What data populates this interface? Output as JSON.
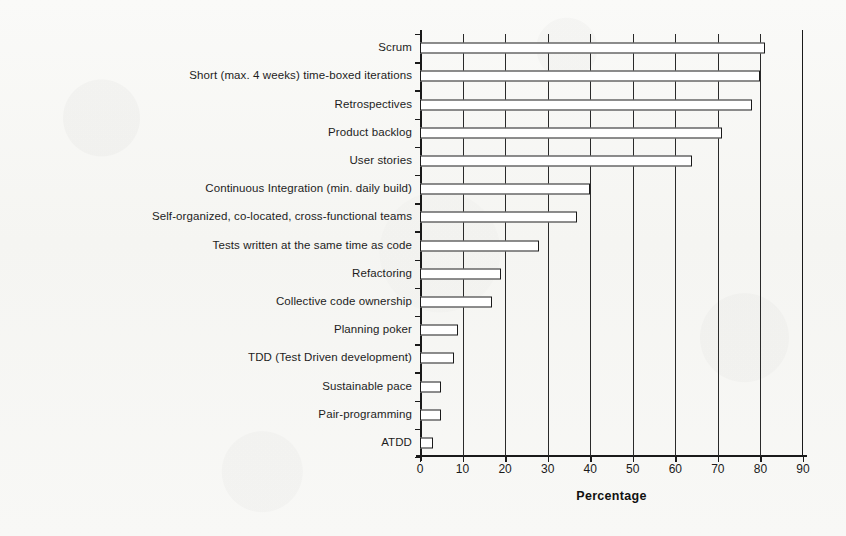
{
  "chart_data": {
    "type": "bar",
    "orientation": "horizontal",
    "title": "",
    "xlabel": "Percentage",
    "ylabel": "",
    "xlim": [
      0,
      90
    ],
    "xticks": [
      0,
      10,
      20,
      30,
      40,
      50,
      60,
      70,
      80,
      90
    ],
    "xticklabels": [
      "0",
      "10",
      "20",
      "30",
      "40",
      "50",
      "60",
      "70",
      "80",
      "90"
    ],
    "grid": "vertical",
    "legend": "none",
    "bar_style": {
      "fill": "#ffffff",
      "edge": "#1a1a1a"
    },
    "categories": [
      "Scrum",
      "Short (max. 4 weeks) time-boxed iterations",
      "Retrospectives",
      "Product backlog",
      "User stories",
      "Continuous Integration (min. daily build)",
      "Self-organized, co-located, cross-functional teams",
      "Tests written at the same time as code",
      "Refactoring",
      "Collective code ownership",
      "Planning poker",
      "TDD (Test Driven development)",
      "Sustainable pace",
      "Pair-programming",
      "ATDD"
    ],
    "values": [
      81,
      80,
      78,
      71,
      64,
      40,
      37,
      28,
      19,
      17,
      9,
      8,
      5,
      5,
      3
    ]
  }
}
